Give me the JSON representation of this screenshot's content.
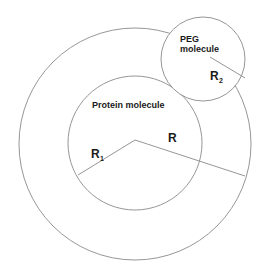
{
  "diagram": {
    "title": "",
    "colors": {
      "stroke": "#8a8a8a",
      "text": "#1a1a1a",
      "background": "#ffffff"
    },
    "shapes": {
      "outer_circle": {
        "cx": 135,
        "cy": 144,
        "r": 116
      },
      "protein_circle": {
        "cx": 135,
        "cy": 143,
        "r": 67
      },
      "peg_circle": {
        "cx": 203,
        "cy": 59,
        "r": 42
      }
    },
    "labels": {
      "protein": "Protein molecule",
      "peg_line1": "PEG",
      "peg_line2": "molecule",
      "r": "R",
      "r1_main": "R",
      "r1_sub": "1",
      "r2_main": "R",
      "r2_sub": "2"
    },
    "lines": {
      "r1": {
        "from": [
          135,
          140
        ],
        "to": [
          78,
          175
        ]
      },
      "r": {
        "from": [
          135,
          140
        ],
        "to": [
          245,
          176
        ]
      },
      "r2": {
        "from": [
          210,
          57
        ],
        "to": [
          245,
          78
        ]
      }
    }
  }
}
